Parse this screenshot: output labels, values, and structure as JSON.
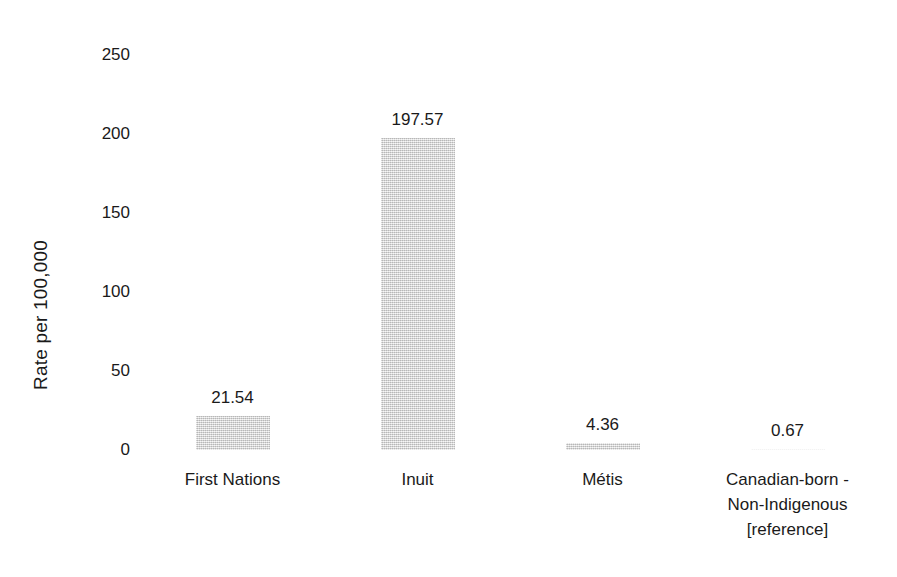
{
  "chart_data": {
    "type": "bar",
    "title": "",
    "subtitle": "",
    "xlabel": "",
    "ylabel": "Rate per 100,000",
    "ylim": [
      0,
      250
    ],
    "yticks": [
      0,
      50,
      100,
      150,
      200,
      250
    ],
    "ytick_labels": [
      "0",
      "50",
      "100",
      "150",
      "200",
      "250"
    ],
    "grid": false,
    "legend": false,
    "legend_position": "none",
    "bar_color": "#dcdcdc",
    "background_color": "#ffffff",
    "text_color": "#1a1a1a",
    "categories": [
      "First Nations",
      "Inuit",
      "Métis",
      "Canadian-born - Non-Indigenous [reference]"
    ],
    "category_label_lines": [
      [
        "First Nations"
      ],
      [
        "Inuit"
      ],
      [
        "Métis"
      ],
      [
        "Canadian-born -",
        "Non-Indigenous",
        "[reference]"
      ]
    ],
    "values": [
      21.54,
      197.57,
      4.36,
      0.67
    ],
    "value_labels": [
      "21.54",
      "197.57",
      "4.36",
      "0.67"
    ]
  }
}
